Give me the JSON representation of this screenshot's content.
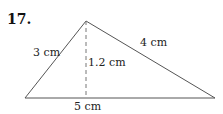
{
  "problem": {
    "number": "17."
  },
  "triangle": {
    "sides": {
      "left": "3 cm",
      "right": "4 cm",
      "base": "5 cm"
    },
    "height": "1.2 cm"
  },
  "colors": {
    "line": "#555555",
    "text": "#222222"
  }
}
